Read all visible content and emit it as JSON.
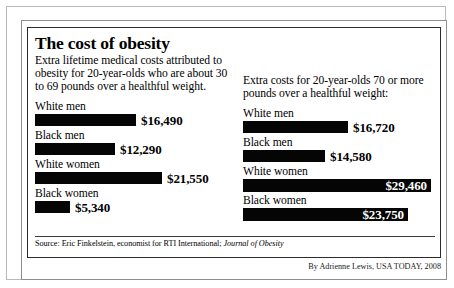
{
  "title": "The cost of obesity",
  "left_column": {
    "deck": "Extra lifetime medical costs attributed to obesity for 20-year-olds who are about 30 to 69 pounds over a healthful weight.",
    "bars": [
      {
        "label": "White men",
        "value_text": "$16,490",
        "value": 16490,
        "bar_px": 101,
        "value_inside": false
      },
      {
        "label": "Black men",
        "value_text": "$12,290",
        "value": 12290,
        "bar_px": 80,
        "value_inside": false
      },
      {
        "label": "White women",
        "value_text": "$21,550",
        "value": 21550,
        "bar_px": 127,
        "value_inside": false
      },
      {
        "label": "Black women",
        "value_text": "$5,340",
        "value": 5340,
        "bar_px": 35,
        "value_inside": false
      }
    ]
  },
  "right_column": {
    "deck": "Extra costs for 20-year-olds 70 or more pounds over a healthful weight:",
    "bars": [
      {
        "label": "White men",
        "value_text": "$16,720",
        "value": 16720,
        "bar_px": 105,
        "value_inside": false
      },
      {
        "label": "Black men",
        "value_text": "$14,580",
        "value": 14580,
        "bar_px": 82,
        "value_inside": false
      },
      {
        "label": "White women",
        "value_text": "$29,460",
        "value": 29460,
        "bar_px": 188,
        "value_inside": true
      },
      {
        "label": "Black women",
        "value_text": "$23,750",
        "value": 23750,
        "bar_px": 165,
        "value_inside": true
      }
    ]
  },
  "source": {
    "prefix": "Source: Eric Finkelstein, economist for RTI International; ",
    "journal": "Journal of Obesity"
  },
  "credit": "By Adrienne Lewis, USA TODAY, 2008",
  "chart_data": {
    "type": "bar",
    "title": "The cost of obesity",
    "xlabel": "Extra lifetime medical costs (US dollars)",
    "ylabel": "",
    "categories": [
      "White men",
      "Black men",
      "White women",
      "Black women"
    ],
    "series": [
      {
        "name": "30 to 69 pounds over a healthful weight",
        "values": [
          16490,
          12290,
          21550,
          5340
        ]
      },
      {
        "name": "70 or more pounds over a healthful weight",
        "values": [
          16720,
          14580,
          29460,
          23750
        ]
      }
    ],
    "value_labels": [
      [
        "$16,490",
        "$12,290",
        "$21,550",
        "$5,340"
      ],
      [
        "$16,720",
        "$14,580",
        "$29,460",
        "$23,750"
      ]
    ],
    "xlim": [
      0,
      29460
    ],
    "grid": false,
    "legend": "none",
    "orientation": "horizontal",
    "bar_color": "#050505"
  },
  "colors": {
    "bar": "#050505",
    "background": "#ffffff",
    "text": "#000000",
    "inside_label": "#ffffff"
  }
}
